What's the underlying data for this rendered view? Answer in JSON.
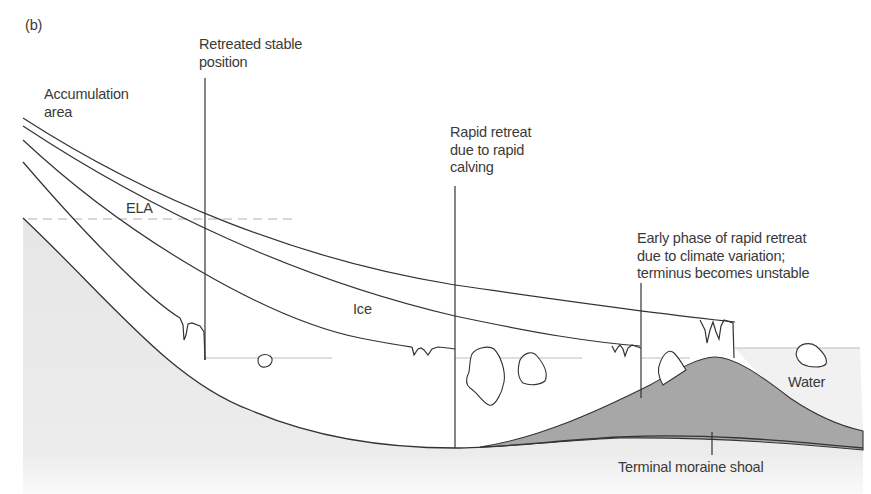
{
  "figure": {
    "panel_label": "(b)",
    "labels": {
      "accumulation_area": "Accumulation\narea",
      "ela": "ELA",
      "retreated_stable_position": "Retreated stable\nposition",
      "rapid_retreat_calving": "Rapid retreat\ndue to rapid\ncalving",
      "early_phase": "Early phase of rapid retreat\ndue to climate variation;\nterminus becomes unstable",
      "ice": "Ice",
      "water": "Water",
      "terminal_moraine_shoal": "Terminal moraine shoal"
    },
    "colors": {
      "bedrock": "#e8e8e8",
      "moraine": "#a7a7a7",
      "line": "#333333",
      "water_line": "#b8b8b8",
      "ela_line": "#b0b0b0",
      "text": "#3a3a3a"
    }
  }
}
